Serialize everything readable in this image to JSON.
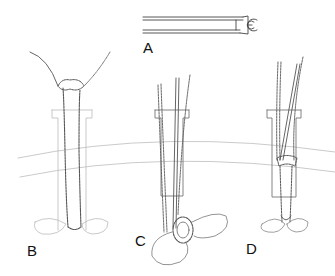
{
  "figure": {
    "panels": [
      {
        "id": "A",
        "label": "A",
        "content": "instrument (grasper) with ring tip"
      },
      {
        "id": "B",
        "label": "B",
        "content": "tube with suture loops through port"
      },
      {
        "id": "C",
        "label": "C",
        "content": "grasper inserted through port, loop at base"
      },
      {
        "id": "D",
        "label": "D",
        "content": "grasper and tube through port, tied at base"
      }
    ],
    "colors": {
      "line": "#555555",
      "faint": "#b5b5b5",
      "background": "#ffffff"
    }
  }
}
